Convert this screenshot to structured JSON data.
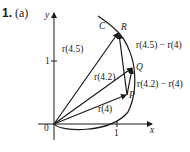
{
  "figure": {
    "number": "1.",
    "part": "(a)"
  },
  "axes": {
    "x_label": "x",
    "y_label": "y",
    "origin_label": "0",
    "x_tick": "1",
    "y_tick": "1"
  },
  "curve": {
    "label": "C"
  },
  "points": {
    "R": "R",
    "Q": "Q",
    "P": "P"
  },
  "vectors": {
    "r45": "r(4.5)",
    "r42": "r(4.2)",
    "r4": "r(4)",
    "diff45": "r(4.5) − r(4)",
    "diff42": "r(4.2) − r(4)"
  }
}
